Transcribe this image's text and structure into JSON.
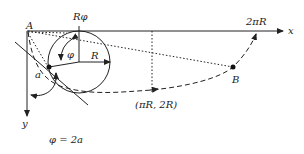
{
  "diagram": {
    "labels": {
      "point_a": "A",
      "point_b": "B",
      "r_phi": "Rφ",
      "phi": "φ",
      "radius": "R",
      "angle_a": "a",
      "x_axis": "x",
      "y_axis": "y",
      "two_pi_r": "2πR",
      "midpoint": "(πR, 2R)",
      "relation": "φ = 2a"
    },
    "colors": {
      "stroke": "#222222",
      "background": "#ffffff"
    }
  }
}
